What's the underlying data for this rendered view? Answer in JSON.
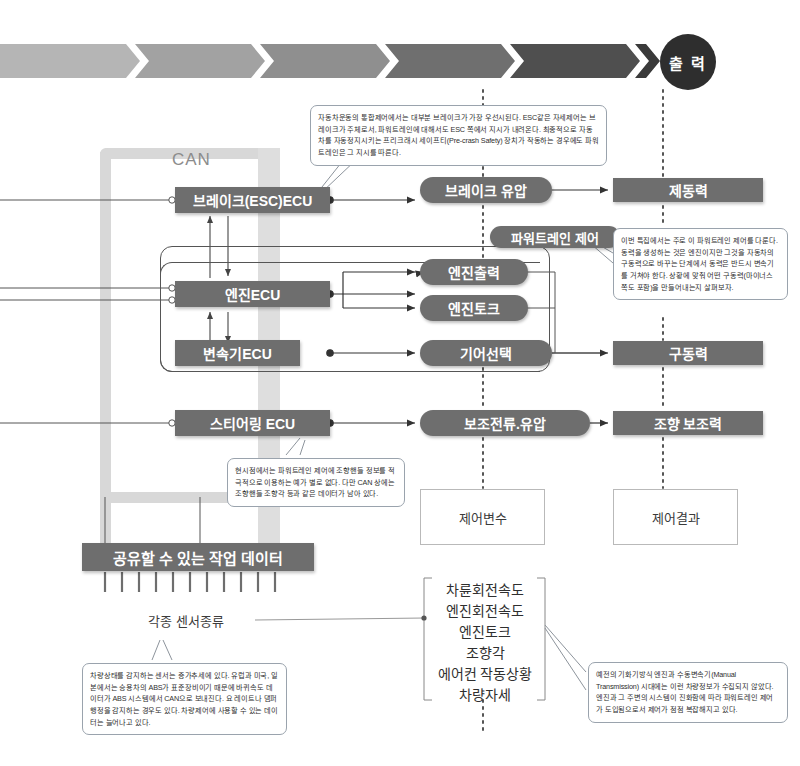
{
  "top_band": {
    "output_label": "출 력",
    "segments": [
      {
        "color": "#b5b5b5"
      },
      {
        "color": "#a2a2a2"
      },
      {
        "color": "#8f8f8f"
      },
      {
        "color": "#6f6f6f"
      },
      {
        "color": "#4f4f4f"
      },
      {
        "color": "#3a3a3a"
      }
    ],
    "circle_color": "#2e2e2e"
  },
  "bus": {
    "label": "CAN",
    "color": "#d8d8d8"
  },
  "ecus": [
    {
      "id": "brake-esc-ecu",
      "label": "브레이크(ESC)ECU"
    },
    {
      "id": "engine-ecu",
      "label": "엔진ECU"
    },
    {
      "id": "transmission-ecu",
      "label": "변속기ECU"
    },
    {
      "id": "steering-ecu",
      "label": "스티어링 ECU"
    }
  ],
  "control_vars": [
    {
      "id": "brake-hydraulic-pressure",
      "label": "브레이크 유압"
    },
    {
      "id": "engine-output",
      "label": "엔진출력"
    },
    {
      "id": "engine-torque",
      "label": "엔진토크"
    },
    {
      "id": "gear-selection",
      "label": "기어선택"
    },
    {
      "id": "assist-current-hydraulic",
      "label": "보조전류.유압"
    }
  ],
  "powertrain_group_label": "파워트레인 제어",
  "results": [
    {
      "id": "braking-force",
      "label": "제동력"
    },
    {
      "id": "driving-force",
      "label": "구동력"
    },
    {
      "id": "steering-assist-force",
      "label": "조향 보조력"
    }
  ],
  "footer_boxes": [
    {
      "id": "control-variable",
      "label": "제어변수"
    },
    {
      "id": "control-result",
      "label": "제어결과"
    }
  ],
  "shared_data": {
    "label": "공유할 수 있는 작업 데이터"
  },
  "sensor_label": "각종 센서종류",
  "signal_list": [
    "차륜회전속도",
    "엔진회전속도",
    "엔진토크",
    "조향각",
    "에어컨 작동상황",
    "차량자세"
  ],
  "callouts": {
    "top": {
      "id": "callout-brake-priority",
      "text": "자동차운동의 통합제어에서는 대부분 브레이크가 가장 우선시된다. ESC같은 자세제어는 브레이크가 주체로서, 파워트레인에 대해서도 ESC 쪽에서 지시가 내려온다. 최종적으로 자동차를 자동정지시키는 프리크래시 세이프티(Pre-crash Safety) 장치가 작동하는 경우에도 파워트레인은 그 지시를 따른다."
    },
    "right": {
      "id": "callout-powertrain-focus",
      "text": "이번 특집에서는 주로 이 파워트레인 제어를 다룬다. 동력을 생성하는 것은 엔진이지만 그것을 자동차의 구동력으로 바꾸는 단계에서 동력은 반드시 변속기를 거쳐야 한다. 상황에 맞춰 어떤 구동력(마이너스 쪽도 포함)을 만들어내는지 살펴보자."
    },
    "middle": {
      "id": "callout-steering-can",
      "text": "현시점에서는 파워트레인 제어에 조향핸들 정보를 적극적으로 이용하는 예가 별로 없다. 다만 CAN 상에는 조향핸들 조향각 등과 같은 데이터가 남아 있다."
    },
    "bottom_left": {
      "id": "callout-sensor-trend",
      "text": "차량상태를 감지하는 센서는 증가추세에 있다. 유럽과 미국, 일본에서는 승용차의 ABS가 표준장비이기 때문에 바퀴속도 데이터가 ABS 시스템에서 CAN으로 보내진다. 요 레이트나 댐퍼 행정을 감지하는 경우도 있다. 차량제어에 사용할 수 있는 데이터는 늘어나고 있다."
    },
    "bottom_right": {
      "id": "callout-history",
      "text": "예전의 기화기방식 엔진과 수동변속기(Manual Transmission) 시대에는 이런 차량정보가 수집되지 않았다. 엔진과 그 주변의 시스템이 진화함에 따라 파워트레인 제어가 도입됨으로서 제어가 점점 복잡해지고 있다."
    }
  },
  "colors": {
    "box_fill": "#6e6e6e",
    "bus_fill": "#d8d8d8",
    "line": "#4a4a4a",
    "dotted": "#555555"
  }
}
